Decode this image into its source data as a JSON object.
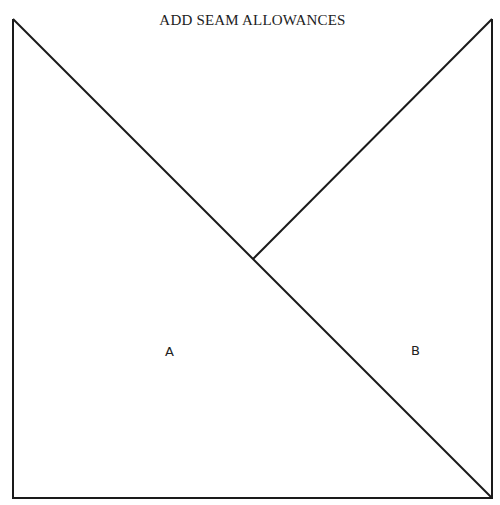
{
  "title": "ADD SEAM ALLOWANCES",
  "pieces": [
    {
      "label": "A",
      "x": 170,
      "y": 353
    },
    {
      "label": "B",
      "x": 416,
      "y": 352
    }
  ],
  "geometry": {
    "square": {
      "x1": 13,
      "y1": 19,
      "x2": 492,
      "y2": 498
    },
    "diagonal": {
      "x1": 13,
      "y1": 19,
      "x2": 492,
      "y2": 498
    },
    "partial_line": {
      "x1": 253,
      "y1": 259,
      "x2": 492,
      "y2": 19
    }
  },
  "colors": {
    "line": "#1a1a1a",
    "background": "#ffffff"
  }
}
